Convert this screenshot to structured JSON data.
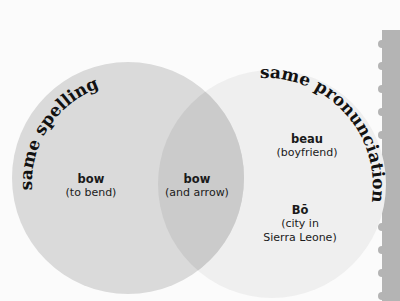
{
  "venn": {
    "left_title": "same spelling",
    "right_title": "same pronunciation",
    "left_only": {
      "word": "bow",
      "definition": "(to bend)"
    },
    "overlap": {
      "word": "bow",
      "definition": "(and arrow)"
    },
    "right_only": [
      {
        "word": "beau",
        "definition": "(boyfriend)"
      },
      {
        "word": "Bō",
        "definition_line1": "(city in",
        "definition_line2": "Sierra Leone)"
      }
    ]
  },
  "colors": {
    "background": "#fbfbfb",
    "left_circle": "#dadada",
    "right_circle": "#efefef",
    "overlap": "#cbcbcb",
    "page_edge": "#b4b4b4"
  }
}
